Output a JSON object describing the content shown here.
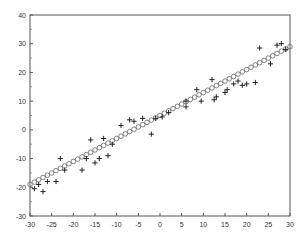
{
  "chart_data": {
    "type": "scatter",
    "title": "",
    "xlabel": "",
    "ylabel": "",
    "xlim": [
      -30,
      30
    ],
    "ylim": [
      -30,
      40
    ],
    "grid": false,
    "legend": null,
    "x_ticks": [
      -30,
      -25,
      -20,
      -15,
      -10,
      -5,
      0,
      5,
      10,
      15,
      20,
      25,
      30
    ],
    "y_ticks": [
      -30,
      -20,
      -10,
      0,
      10,
      20,
      30,
      40
    ],
    "series": [
      {
        "name": "observed",
        "marker": "plus",
        "points": [
          [
            -29,
            -20.5
          ],
          [
            -28,
            -19
          ],
          [
            -27,
            -21.5
          ],
          [
            -26,
            -18
          ],
          [
            -24,
            -18
          ],
          [
            -23,
            -10
          ],
          [
            -22,
            -14
          ],
          [
            -18,
            -14
          ],
          [
            -17,
            -10
          ],
          [
            -16,
            -3.5
          ],
          [
            -15,
            -11.5
          ],
          [
            -14,
            -10
          ],
          [
            -13,
            -3
          ],
          [
            -12,
            -9
          ],
          [
            -11,
            -5
          ],
          [
            -9,
            1.5
          ],
          [
            -7,
            3.5
          ],
          [
            -6,
            3
          ],
          [
            -4,
            4
          ],
          [
            -2,
            -1.5
          ],
          [
            -1,
            4
          ],
          [
            0.5,
            4.5
          ],
          [
            2,
            6
          ],
          [
            6,
            10
          ],
          [
            6,
            8
          ],
          [
            8.5,
            14
          ],
          [
            9.5,
            10
          ],
          [
            12,
            17.5
          ],
          [
            12.5,
            10.5
          ],
          [
            13,
            11.5
          ],
          [
            15,
            13
          ],
          [
            15.5,
            14
          ],
          [
            17,
            16
          ],
          [
            18,
            17
          ],
          [
            19,
            15.5
          ],
          [
            20,
            16
          ],
          [
            22,
            16.5
          ],
          [
            23,
            28.5
          ],
          [
            25.5,
            23
          ],
          [
            27,
            29.5
          ],
          [
            28,
            30
          ],
          [
            29,
            28
          ]
        ]
      },
      {
        "name": "fitted",
        "marker": "circle",
        "line": {
          "slope": 0.8,
          "intercept": 5,
          "x_start": -30,
          "x_end": 30,
          "step": 1
        }
      }
    ]
  }
}
